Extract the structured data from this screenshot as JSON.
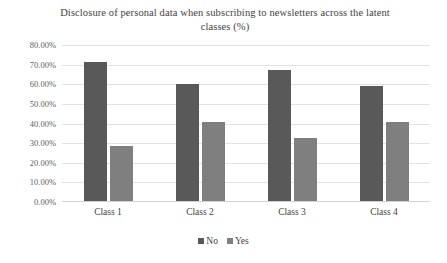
{
  "chart_data": {
    "type": "bar",
    "title": "Disclosure of personal data when subscribing to newsletters across the latent classes (%)",
    "xlabel": "",
    "ylabel": "",
    "categories": [
      "Class 1",
      "Class 2",
      "Class 3",
      "Class 4"
    ],
    "series": [
      {
        "name": "No",
        "color": "#595959",
        "values": [
          71.0,
          59.5,
          67.0,
          58.5
        ]
      },
      {
        "name": "Yes",
        "color": "#7f7f7f",
        "values": [
          28.0,
          40.5,
          32.0,
          40.5
        ]
      }
    ],
    "ylim": [
      0,
      80
    ],
    "ytick_values": [
      80,
      70,
      60,
      50,
      40,
      30,
      20,
      10,
      0
    ],
    "ytick_labels": [
      "80.00%",
      "70.00%",
      "60.00%",
      "50.00%",
      "40.00%",
      "30.00%",
      "20.00%",
      "10.00%",
      "0.00%"
    ],
    "grid": true,
    "legend_position": "bottom",
    "legend_entries": [
      "No",
      "Yes"
    ]
  }
}
